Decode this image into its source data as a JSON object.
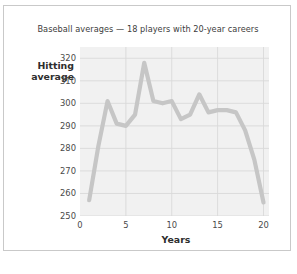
{
  "card": {
    "border_color": "#c9c9c9",
    "background": "#ffffff"
  },
  "chart_data": {
    "type": "line",
    "title": "Baseball averages — 18 players with 20-year careers",
    "xlabel": "Years",
    "ylabel": "Hitting average",
    "ylabel_line1": "Hitting",
    "ylabel_line2": "average",
    "xlim": [
      0,
      20.6
    ],
    "ylim": [
      250,
      325
    ],
    "xticks": [
      0,
      5,
      10,
      15,
      20
    ],
    "xtick_labels": [
      "0",
      "5",
      "10",
      "15",
      "20"
    ],
    "yticks": [
      250,
      260,
      270,
      280,
      290,
      300,
      310,
      320
    ],
    "ytick_labels": [
      "250",
      "260",
      "270",
      "280",
      "290",
      "300",
      "310",
      "320"
    ],
    "grid": "both",
    "legend": "none",
    "line_color": "#c6c6c6",
    "line_width": 4.2,
    "plot_background": "#f1f1f1",
    "gridline_color": "#d9d9d9",
    "x": [
      1,
      2,
      3,
      4,
      5,
      6,
      7,
      8,
      9,
      10,
      11,
      12,
      13,
      14,
      15,
      16,
      17,
      18,
      19,
      20
    ],
    "values": [
      257,
      281,
      301,
      291,
      290,
      295,
      318,
      301,
      300,
      301,
      293,
      295,
      304,
      296,
      297,
      297,
      296,
      288,
      275,
      256
    ],
    "series": [
      {
        "name": "Hitting average",
        "values": [
          257,
          281,
          301,
          291,
          290,
          295,
          318,
          301,
          300,
          301,
          293,
          295,
          304,
          296,
          297,
          297,
          296,
          288,
          275,
          256
        ]
      }
    ]
  }
}
